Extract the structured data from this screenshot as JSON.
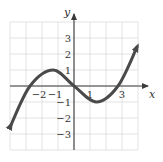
{
  "chart_data": {
    "type": "line",
    "title": "",
    "xlabel": "x",
    "ylabel": "y",
    "xlim": [
      -4,
      4
    ],
    "ylim": [
      -4,
      4
    ],
    "grid": true,
    "grid_step": 1,
    "x_tick_labels": [
      {
        "value": -2,
        "label": "−2"
      },
      {
        "value": -1,
        "label": "−1"
      },
      {
        "value": 1,
        "label": "1"
      },
      {
        "value": 3,
        "label": "3"
      }
    ],
    "y_tick_labels": [
      {
        "value": 3,
        "label": "3"
      },
      {
        "value": 2,
        "label": "2"
      },
      {
        "value": 1,
        "label": "1"
      },
      {
        "value": -1,
        "label": "−1"
      },
      {
        "value": -2,
        "label": "−2"
      },
      {
        "value": -3,
        "label": "−3"
      }
    ],
    "series": [
      {
        "name": "f(x)",
        "description": "cubic-shaped curve with arrows at both ends",
        "points": [
          {
            "x": -3.94,
            "y": -2.44
          },
          {
            "x": -2.75,
            "y": 0
          },
          {
            "x": -1.3,
            "y": 1
          },
          {
            "x": 0,
            "y": 0
          },
          {
            "x": 1.4,
            "y": -1
          },
          {
            "x": 2.75,
            "y": 0
          },
          {
            "x": 3.94,
            "y": 2.44
          }
        ],
        "local_max": {
          "x": -1.3,
          "y": 1
        },
        "local_min": {
          "x": 1.4,
          "y": -1
        },
        "x_intercepts": [
          -2.75,
          0,
          2.75
        ],
        "y_intercept": 0,
        "end_behavior": "arrows at both ends"
      }
    ],
    "colors": {
      "curve": "#4a4a4a",
      "axes": "#3a3a3a",
      "grid": "#dcdcdc"
    }
  }
}
